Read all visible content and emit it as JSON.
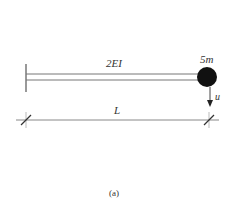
{
  "diagram": {
    "beam_stiffness_label": "2EI",
    "mass_label": "5m",
    "displacement_label": "u",
    "length_label": "L",
    "caption": "(a)",
    "elements": {
      "support": "fixed-wall",
      "beam": "cantilever",
      "mass": "lumped-mass-at-tip",
      "displacement": "vertical-downward"
    },
    "colors": {
      "line": "#555555",
      "mass": "#111111",
      "text": "#333333"
    }
  }
}
